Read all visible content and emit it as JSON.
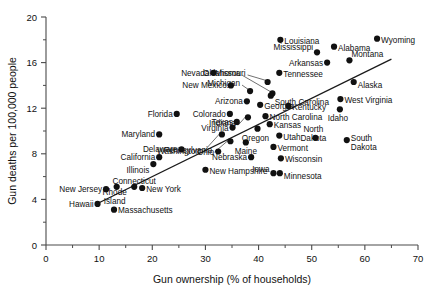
{
  "chart_data": {
    "type": "scatter",
    "title": "",
    "xlabel": "Gun ownership (% of households)",
    "ylabel": "Gun deaths per 100,000 people",
    "xlim": [
      0,
      70
    ],
    "ylim": [
      0,
      20
    ],
    "xticks": [
      0,
      10,
      20,
      30,
      40,
      50,
      60,
      70
    ],
    "yticks": [
      0,
      4,
      8,
      12,
      16,
      20
    ],
    "xtick_labels": [
      "0",
      "10",
      "20",
      "30",
      "40",
      "50",
      "60",
      "70"
    ],
    "ytick_labels": [
      "0",
      "4",
      "8",
      "12",
      "16",
      "20"
    ],
    "grid": false,
    "legend": "none",
    "minor_ticks": true,
    "trendline": {
      "x0": 9.5,
      "y0": 3.6,
      "x1": 65.0,
      "y1": 16.3
    },
    "point_color": "#111111",
    "points": [
      {
        "name": "Hawaii",
        "x": 9.7,
        "y": 3.6,
        "lx": -4,
        "ly": 0,
        "anchor": "end"
      },
      {
        "name": "New Jersey",
        "x": 11.3,
        "y": 4.9,
        "lx": -4,
        "ly": 0,
        "anchor": "end"
      },
      {
        "name": "Massachusetts",
        "x": 12.8,
        "y": 3.1,
        "lx": 4,
        "ly": 0,
        "anchor": "start"
      },
      {
        "name": "Rhode Island",
        "x": 13.3,
        "y": 5.1,
        "lx": -2,
        "ly": 8,
        "anchor": "middle",
        "two": true
      },
      {
        "name": "Connecticut",
        "x": 16.6,
        "y": 5.1,
        "lx": 0,
        "ly": -6,
        "anchor": "middle"
      },
      {
        "name": "New York",
        "x": 18.1,
        "y": 5.0,
        "lx": 4,
        "ly": 1,
        "anchor": "start"
      },
      {
        "name": "California",
        "x": 21.3,
        "y": 7.7,
        "lx": -4,
        "ly": 0,
        "anchor": "end"
      },
      {
        "name": "Illinois",
        "x": 20.2,
        "y": 7.1,
        "lx": -4,
        "ly": 6,
        "anchor": "end"
      },
      {
        "name": "Maryland",
        "x": 21.3,
        "y": 9.7,
        "lx": -4,
        "ly": 0,
        "anchor": "end"
      },
      {
        "name": "Delaware",
        "x": 25.5,
        "y": 8.4,
        "lx": -4,
        "ly": 0,
        "anchor": "end"
      },
      {
        "name": "Florida",
        "x": 24.6,
        "y": 11.5,
        "lx": -4,
        "ly": 0,
        "anchor": "end"
      },
      {
        "name": "Ohio",
        "x": 32.4,
        "y": 8.2,
        "lx": -4,
        "ly": 0,
        "anchor": "end"
      },
      {
        "name": "Pennsylvania",
        "x": 34.7,
        "y": 9.1,
        "lx": -18,
        "ly": 9,
        "anchor": "end",
        "leader": true
      },
      {
        "name": "Washington",
        "x": 33.1,
        "y": 9.7,
        "lx": -22,
        "ly": 17,
        "anchor": "end",
        "leader": true
      },
      {
        "name": "New Hampshire",
        "x": 30.0,
        "y": 6.6,
        "lx": 4,
        "ly": 1,
        "anchor": "start"
      },
      {
        "name": "Nebraska",
        "x": 38.6,
        "y": 7.7,
        "lx": -4,
        "ly": 0,
        "anchor": "end"
      },
      {
        "name": "Maine",
        "x": 37.6,
        "y": 9.0,
        "lx": 0,
        "ly": 9,
        "anchor": "middle"
      },
      {
        "name": "Iowa",
        "x": 42.8,
        "y": 6.3,
        "lx": -4,
        "ly": -4,
        "anchor": "end"
      },
      {
        "name": "Minnesota",
        "x": 44.0,
        "y": 6.3,
        "lx": 4,
        "ly": 3,
        "anchor": "start"
      },
      {
        "name": "Wisconsin",
        "x": 44.2,
        "y": 7.6,
        "lx": 4,
        "ly": 1,
        "anchor": "start"
      },
      {
        "name": "Vermont",
        "x": 42.8,
        "y": 8.6,
        "lx": 4,
        "ly": 1,
        "anchor": "start"
      },
      {
        "name": "Oregon",
        "x": 39.8,
        "y": 10.2,
        "lx": -2,
        "ly": 9,
        "anchor": "middle"
      },
      {
        "name": "Utah",
        "x": 43.9,
        "y": 9.6,
        "lx": 4,
        "ly": 1,
        "anchor": "start"
      },
      {
        "name": "Kansas",
        "x": 42.1,
        "y": 10.6,
        "lx": 4,
        "ly": 1,
        "anchor": "start"
      },
      {
        "name": "Virginia",
        "x": 35.1,
        "y": 10.3,
        "lx": -4,
        "ly": 0,
        "anchor": "end"
      },
      {
        "name": "Texas",
        "x": 35.9,
        "y": 10.8,
        "lx": -4,
        "ly": 0,
        "anchor": "end"
      },
      {
        "name": "Colorado",
        "x": 34.6,
        "y": 11.5,
        "lx": -4,
        "ly": 0,
        "anchor": "end"
      },
      {
        "name": "Indiana",
        "x": 38.0,
        "y": 11.2,
        "lx": -12,
        "ly": 6,
        "anchor": "end",
        "leader": true
      },
      {
        "name": "North Carolina",
        "x": 41.3,
        "y": 11.3,
        "lx": 4,
        "ly": 1,
        "anchor": "start"
      },
      {
        "name": "Arizona",
        "x": 37.8,
        "y": 12.6,
        "lx": -4,
        "ly": 0,
        "anchor": "end"
      },
      {
        "name": "Georgia",
        "x": 40.3,
        "y": 12.3,
        "lx": 4,
        "ly": 1,
        "anchor": "start"
      },
      {
        "name": "Kentucky",
        "x": 45.6,
        "y": 12.2,
        "lx": 4,
        "ly": 1,
        "anchor": "start"
      },
      {
        "name": "Michigan",
        "x": 38.4,
        "y": 13.5,
        "lx": -10,
        "ly": -8,
        "anchor": "end",
        "leader": true
      },
      {
        "name": "West Virginia",
        "x": 55.4,
        "y": 12.8,
        "lx": 4,
        "ly": 1,
        "anchor": "start"
      },
      {
        "name": "Idaho",
        "x": 55.3,
        "y": 11.9,
        "lx": -2,
        "ly": 9,
        "anchor": "middle"
      },
      {
        "name": "North Dakota",
        "x": 50.7,
        "y": 9.4,
        "lx": -2,
        "ly": -6,
        "anchor": "middle",
        "two": true
      },
      {
        "name": "South Dakota",
        "x": 56.6,
        "y": 9.2,
        "lx": 4,
        "ly": 1,
        "anchor": "start",
        "two": true
      },
      {
        "name": "New Mexico",
        "x": 34.8,
        "y": 14.0,
        "lx": -4,
        "ly": 0,
        "anchor": "end"
      },
      {
        "name": "Nevada",
        "x": 31.5,
        "y": 15.1,
        "lx": -4,
        "ly": 0,
        "anchor": "end"
      },
      {
        "name": "Missouri",
        "x": 41.7,
        "y": 14.3,
        "lx": -22,
        "ly": -9,
        "anchor": "end",
        "leader": true
      },
      {
        "name": "Oklahoma",
        "x": 42.6,
        "y": 13.3,
        "lx": -32,
        "ly": -20,
        "anchor": "end",
        "leader": true
      },
      {
        "name": "Tennessee",
        "x": 43.9,
        "y": 15.1,
        "lx": 4,
        "ly": 1,
        "anchor": "start"
      },
      {
        "name": "South Carolina",
        "x": 42.3,
        "y": 13.1,
        "lx": 4,
        "ly": 6,
        "anchor": "start"
      },
      {
        "name": "Louisiana",
        "x": 44.1,
        "y": 18.0,
        "lx": 4,
        "ly": 1,
        "anchor": "start"
      },
      {
        "name": "Mississippi",
        "x": 51.0,
        "y": 16.9,
        "lx": -4,
        "ly": -5,
        "anchor": "end"
      },
      {
        "name": "Arkansas",
        "x": 52.9,
        "y": 16.0,
        "lx": -4,
        "ly": 0,
        "anchor": "end"
      },
      {
        "name": "Alabama",
        "x": 54.2,
        "y": 17.4,
        "lx": 4,
        "ly": 1,
        "anchor": "start"
      },
      {
        "name": "Montana",
        "x": 57.1,
        "y": 16.2,
        "lx": 2,
        "ly": -6,
        "anchor": "start"
      },
      {
        "name": "Alaska",
        "x": 57.9,
        "y": 14.3,
        "lx": 4,
        "ly": 3,
        "anchor": "start"
      },
      {
        "name": "Wyoming",
        "x": 62.3,
        "y": 18.1,
        "lx": 4,
        "ly": 1,
        "anchor": "start"
      }
    ]
  }
}
